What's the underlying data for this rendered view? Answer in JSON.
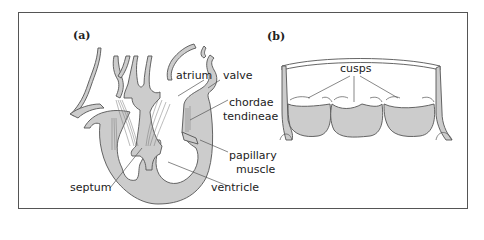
{
  "figure": {
    "panels": [
      {
        "id": "a",
        "label": "(a)",
        "subject": "heart cross-section",
        "annotations": {
          "atrium": "atrium",
          "valve": "valve",
          "chordae_line1": "chordae",
          "chordae_line2": "tendineae",
          "papillary_line1": "papillary",
          "papillary_line2": "muscle",
          "septum": "septum",
          "ventricle": "ventricle"
        }
      },
      {
        "id": "b",
        "label": "(b)",
        "subject": "semilunar valve",
        "annotations": {
          "cusps": "cusps"
        }
      }
    ],
    "colors": {
      "fill": "#cccccc",
      "stroke": "#555555",
      "frame": "#555555"
    }
  }
}
